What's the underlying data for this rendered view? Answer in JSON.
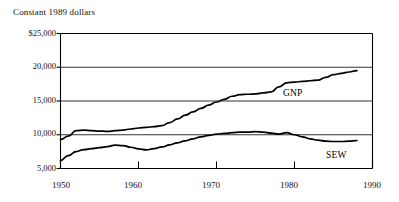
{
  "chart_data": {
    "type": "line",
    "title": "Constant 1989 dollars",
    "xlabel": "",
    "ylabel": "",
    "xlim": [
      1950,
      1990
    ],
    "ylim": [
      5000,
      25000
    ],
    "grid": true,
    "legend_position": "inline-annotation",
    "xticks": [
      1950,
      1960,
      1970,
      1980,
      1990
    ],
    "xticklabels": [
      "1950",
      "1960",
      "1970",
      "1980",
      "1990"
    ],
    "yticks": [
      5000,
      10000,
      15000,
      20000,
      25000
    ],
    "yticklabels": [
      "5,000",
      "10,000",
      "15,000",
      "20,000",
      "$25,000"
    ],
    "annotations": [
      {
        "text": "GNP",
        "x": 1975.5,
        "y": 15600
      },
      {
        "text": "SEW",
        "x": 1981.5,
        "y": 7300
      }
    ],
    "series": [
      {
        "name": "GNP",
        "x": [
          1950,
          1951,
          1952,
          1953,
          1954,
          1955,
          1956,
          1957,
          1958,
          1959,
          1960,
          1961,
          1962,
          1963,
          1964,
          1965,
          1966,
          1967,
          1968,
          1969,
          1970,
          1971,
          1972,
          1973,
          1974,
          1975,
          1976,
          1977,
          1978,
          1979,
          1980,
          1981,
          1982,
          1983,
          1984,
          1985,
          1986,
          1987,
          1988
        ],
        "values": [
          9300,
          9800,
          10600,
          10700,
          10600,
          10550,
          10500,
          10600,
          10700,
          10850,
          11000,
          11100,
          11200,
          11350,
          11800,
          12350,
          12900,
          13400,
          13900,
          14400,
          14850,
          15250,
          15700,
          15950,
          16000,
          16050,
          16200,
          16350,
          17100,
          17700,
          17800,
          17900,
          18000,
          18100,
          18500,
          18900,
          19100,
          19300,
          19500
        ]
      },
      {
        "name": "SEW",
        "x": [
          1950,
          1951,
          1952,
          1953,
          1954,
          1955,
          1956,
          1957,
          1958,
          1959,
          1960,
          1961,
          1962,
          1963,
          1964,
          1965,
          1966,
          1967,
          1968,
          1969,
          1970,
          1971,
          1972,
          1973,
          1974,
          1975,
          1976,
          1977,
          1978,
          1979,
          1980,
          1981,
          1982,
          1983,
          1984,
          1985,
          1986,
          1987,
          1988
        ],
        "values": [
          6200,
          6900,
          7500,
          7800,
          7950,
          8100,
          8250,
          8450,
          8400,
          8150,
          7900,
          7750,
          7950,
          8200,
          8500,
          8800,
          9100,
          9400,
          9700,
          9900,
          10100,
          10200,
          10300,
          10400,
          10400,
          10450,
          10400,
          10250,
          10100,
          10300,
          10000,
          9700,
          9400,
          9200,
          9050,
          9000,
          9000,
          9050,
          9150
        ]
      }
    ]
  },
  "axis": {
    "ytick_labels": [
      "$25,000",
      "20,000",
      "15,000",
      "10,000",
      "5,000"
    ],
    "xtick_labels": [
      "1950",
      "1960",
      "1970",
      "1980",
      "1990"
    ]
  },
  "labels": {
    "gnp": "GNP",
    "sew": "SEW"
  }
}
